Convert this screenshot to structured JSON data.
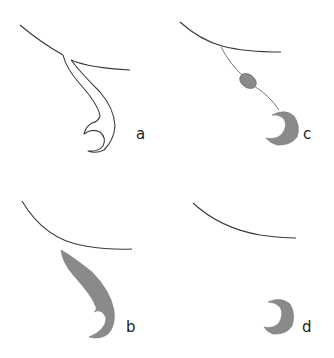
{
  "figure": {
    "panels": [
      {
        "id": "a",
        "label": "a",
        "description": "curved surface with outlined hooked stalk"
      },
      {
        "id": "b",
        "label": "b",
        "description": "curved surface with gray filled hooked stalk"
      },
      {
        "id": "c",
        "label": "c",
        "description": "curved surface with thread, bead and gray crescent"
      },
      {
        "id": "d",
        "label": "d",
        "description": "curved surface and detached gray crescent"
      }
    ]
  },
  "colors": {
    "line": "#3a3a3a",
    "fill_gray": "#8a8a8a",
    "background": "#ffffff"
  }
}
